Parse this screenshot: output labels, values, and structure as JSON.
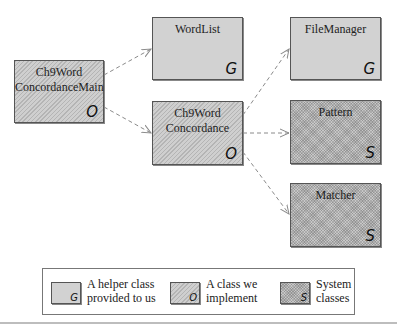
{
  "diagram": {
    "nodes": [
      {
        "id": "main",
        "label_line1": "Ch9Word",
        "label_line2": "ConcordanceMain",
        "tag": "O",
        "kind": "class-we-implement"
      },
      {
        "id": "wordlist",
        "label_line1": "WordList",
        "label_line2": "",
        "tag": "G",
        "kind": "helper-class"
      },
      {
        "id": "concordance",
        "label_line1": "Ch9Word",
        "label_line2": "Concordance",
        "tag": "O",
        "kind": "class-we-implement"
      },
      {
        "id": "filemanager",
        "label_line1": "FileManager",
        "label_line2": "",
        "tag": "G",
        "kind": "helper-class"
      },
      {
        "id": "pattern",
        "label_line1": "Pattern",
        "label_line2": "",
        "tag": "S",
        "kind": "system-class"
      },
      {
        "id": "matcher",
        "label_line1": "Matcher",
        "label_line2": "",
        "tag": "S",
        "kind": "system-class"
      }
    ],
    "edges": [
      {
        "from": "main",
        "to": "wordlist",
        "style": "dashed-arrow"
      },
      {
        "from": "main",
        "to": "concordance",
        "style": "dashed-arrow"
      },
      {
        "from": "concordance",
        "to": "filemanager",
        "style": "dashed-arrow"
      },
      {
        "from": "concordance",
        "to": "pattern",
        "style": "dashed-arrow"
      },
      {
        "from": "concordance",
        "to": "matcher",
        "style": "dashed-arrow"
      }
    ]
  },
  "legend": {
    "items": [
      {
        "tag": "G",
        "line1": "A helper class",
        "line2": "provided to us"
      },
      {
        "tag": "O",
        "line1": "A class we",
        "line2": "implement"
      },
      {
        "tag": "S",
        "line1": "System",
        "line2": "classes"
      }
    ]
  },
  "colors": {
    "edge": "#8a8a8a",
    "border": "#555555",
    "helper_fill": "#d2d2d2"
  }
}
